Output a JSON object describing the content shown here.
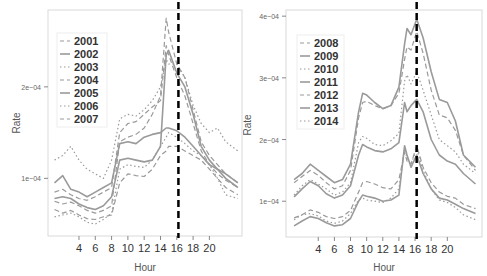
{
  "chart_data": [
    {
      "type": "line",
      "title": "",
      "xlabel": "Hour",
      "ylabel": "Rate",
      "x_ticks": [
        4,
        6,
        8,
        10,
        12,
        14,
        16,
        18,
        20
      ],
      "y_ticks": [
        {
          "value": 0.0001,
          "label": "1e−04"
        },
        {
          "value": 0.0002,
          "label": "2e−04"
        }
      ],
      "xlim": [
        0.2,
        24
      ],
      "ylim": [
        3.7e-05,
        0.000284
      ],
      "vline": {
        "x": 16.2,
        "style": "dashed",
        "color": "#000000"
      },
      "grid": false,
      "legend_position": "top-left inside",
      "x": [
        1,
        2,
        3,
        4,
        5,
        6,
        7,
        8,
        9,
        10,
        11,
        12,
        13,
        14,
        14.7,
        15,
        16,
        17,
        18,
        19,
        20,
        21,
        22,
        23.5
      ],
      "series": [
        {
          "name": "2001",
          "style": "dashed",
          "values": [
            0.66,
            0.62,
            0.65,
            0.6,
            0.56,
            0.55,
            0.58,
            0.6,
            0.95,
            1.05,
            1.03,
            1.02,
            1.1,
            1.25,
            1.3,
            1.35,
            1.35,
            1.3,
            1.25,
            1.2,
            1.1,
            1.0,
            0.9,
            0.82
          ]
        },
        {
          "name": "2002",
          "style": "solid",
          "values": [
            0.78,
            0.8,
            0.78,
            0.72,
            0.68,
            0.66,
            0.7,
            0.8,
            1.2,
            1.22,
            1.2,
            1.18,
            1.2,
            1.35,
            2.35,
            2.4,
            2.15,
            2.0,
            1.7,
            1.35,
            1.2,
            1.1,
            1.0,
            0.9
          ]
        },
        {
          "name": "2003",
          "style": "dotted",
          "values": [
            1.2,
            1.25,
            1.35,
            1.2,
            1.1,
            1.05,
            1.0,
            1.2,
            1.65,
            1.7,
            1.68,
            1.75,
            1.85,
            2.0,
            2.3,
            2.25,
            2.25,
            2.1,
            1.8,
            1.6,
            1.5,
            1.55,
            1.4,
            1.3
          ]
        },
        {
          "name": "2004",
          "style": "dashed",
          "values": [
            0.75,
            0.72,
            0.74,
            0.7,
            0.65,
            0.62,
            0.65,
            0.7,
            1.4,
            1.45,
            1.48,
            1.55,
            1.7,
            1.9,
            2.75,
            2.6,
            2.25,
            2.1,
            1.75,
            1.4,
            1.25,
            1.15,
            1.05,
            0.95
          ]
        },
        {
          "name": "2005",
          "style": "solid",
          "values": [
            0.95,
            1.03,
            0.88,
            0.85,
            0.8,
            0.85,
            0.9,
            0.95,
            1.38,
            1.4,
            1.38,
            1.45,
            1.48,
            1.5,
            1.55,
            1.55,
            1.52,
            1.45,
            1.35,
            1.25,
            1.15,
            1.1,
            1.05,
            0.95
          ]
        },
        {
          "name": "2006",
          "style": "dotted",
          "values": [
            0.58,
            0.6,
            0.62,
            0.58,
            0.52,
            0.5,
            0.55,
            0.62,
            1.1,
            1.15,
            1.13,
            1.12,
            1.2,
            1.35,
            1.45,
            1.5,
            1.45,
            1.38,
            1.3,
            1.25,
            1.15,
            1.0,
            0.82,
            0.78
          ]
        },
        {
          "name": "2007",
          "style": "dashed",
          "values": [
            0.85,
            0.88,
            0.82,
            0.78,
            0.76,
            0.8,
            0.85,
            0.9,
            1.5,
            1.6,
            1.62,
            1.7,
            1.78,
            1.85,
            2.45,
            2.35,
            2.1,
            1.9,
            1.6,
            1.3,
            1.15,
            1.05,
            0.98,
            0.9
          ]
        }
      ]
    },
    {
      "type": "line",
      "title": "",
      "xlabel": "Hour",
      "ylabel": "Rate",
      "x_ticks": [
        4,
        6,
        8,
        10,
        12,
        14,
        16,
        18,
        20
      ],
      "y_ticks": [
        {
          "value": 0.0001,
          "label": "1e−04"
        },
        {
          "value": 0.0002,
          "label": "2e−04"
        },
        {
          "value": 0.0003,
          "label": "3e−04"
        },
        {
          "value": 0.0004,
          "label": "4e−04"
        }
      ],
      "xlim": [
        0,
        24.3
      ],
      "ylim": [
        4.2e-05,
        0.00041
      ],
      "vline": {
        "x": 16.2,
        "style": "dashed",
        "color": "#000000"
      },
      "grid": false,
      "legend_position": "top-left inside",
      "x": [
        1,
        2,
        3,
        4,
        5,
        6,
        7,
        8,
        9,
        9.5,
        10,
        11,
        12,
        13,
        14,
        14.7,
        15,
        15.5,
        16.2,
        17,
        18,
        19,
        20,
        21,
        22,
        23.5
      ],
      "series": [
        {
          "name": "2008",
          "style": "dashed",
          "values": [
            0.73,
            0.78,
            0.86,
            0.82,
            0.75,
            0.72,
            0.75,
            0.85,
            1.15,
            1.3,
            1.32,
            1.28,
            1.22,
            1.2,
            1.35,
            1.8,
            1.65,
            1.6,
            1.9,
            1.55,
            1.3,
            1.15,
            1.08,
            1.05,
            0.95,
            0.88
          ]
        },
        {
          "name": "2009",
          "style": "solid",
          "values": [
            1.35,
            1.45,
            1.6,
            1.5,
            1.4,
            1.3,
            1.35,
            1.6,
            2.45,
            2.75,
            2.72,
            2.6,
            2.5,
            2.55,
            2.85,
            3.55,
            3.8,
            3.7,
            3.95,
            3.65,
            3.1,
            2.65,
            2.6,
            2.3,
            1.75,
            1.55
          ]
        },
        {
          "name": "2010",
          "style": "dotted",
          "values": [
            1.1,
            1.25,
            1.35,
            1.28,
            1.2,
            1.1,
            1.15,
            1.3,
            1.95,
            2.05,
            2.02,
            1.92,
            1.9,
            1.98,
            2.1,
            2.95,
            3.05,
            2.9,
            3.1,
            2.8,
            2.4,
            2.0,
            1.9,
            1.8,
            1.6,
            1.45
          ]
        },
        {
          "name": "2011",
          "style": "solid",
          "values": [
            1.07,
            1.2,
            1.32,
            1.25,
            1.12,
            1.05,
            1.1,
            1.25,
            1.75,
            1.92,
            1.88,
            1.82,
            1.8,
            1.85,
            1.95,
            2.6,
            2.45,
            2.55,
            2.65,
            2.45,
            2.0,
            1.75,
            1.65,
            1.6,
            1.45,
            1.28
          ]
        },
        {
          "name": "2012",
          "style": "dashed",
          "values": [
            1.3,
            1.4,
            1.5,
            1.42,
            1.3,
            1.2,
            1.25,
            1.5,
            2.35,
            2.6,
            2.62,
            2.55,
            2.5,
            2.55,
            2.75,
            3.3,
            3.5,
            3.45,
            3.75,
            3.4,
            2.8,
            2.4,
            2.35,
            2.15,
            1.75,
            1.5
          ]
        },
        {
          "name": "2013",
          "style": "solid",
          "values": [
            0.6,
            0.68,
            0.75,
            0.72,
            0.65,
            0.6,
            0.62,
            0.72,
            1.0,
            1.1,
            1.08,
            1.05,
            1.0,
            1.02,
            1.1,
            1.9,
            1.75,
            1.55,
            1.75,
            1.45,
            1.2,
            1.05,
            1.02,
            0.95,
            0.88,
            0.8
          ]
        },
        {
          "name": "2014",
          "style": "dotted",
          "values": [
            0.7,
            0.78,
            0.8,
            0.76,
            0.68,
            0.64,
            0.68,
            0.8,
            1.02,
            1.05,
            1.02,
            1.0,
            0.98,
            1.05,
            1.2,
            1.85,
            1.7,
            1.6,
            1.85,
            1.5,
            1.2,
            1.02,
            0.98,
            0.9,
            0.78,
            0.7
          ]
        }
      ]
    }
  ],
  "panels": [
    {
      "legend": [
        "2001",
        "2002",
        "2003",
        "2004",
        "2005",
        "2006",
        "2007"
      ],
      "xlabel": "Hour",
      "ylabel": "Rate",
      "tick_labels_x": [
        "4",
        "6",
        "8",
        "10",
        "12",
        "14",
        "16",
        "18",
        "20"
      ],
      "tick_labels_y": [
        "1e−04",
        "2e−04"
      ]
    },
    {
      "legend": [
        "2008",
        "2009",
        "2010",
        "2011",
        "2012",
        "2013",
        "2014"
      ],
      "xlabel": "Hour",
      "ylabel": "Rate",
      "tick_labels_x": [
        "4",
        "6",
        "8",
        "10",
        "12",
        "14",
        "16",
        "18",
        "20"
      ],
      "tick_labels_y": [
        "1e−04",
        "2e−04",
        "3e−04",
        "4e−04"
      ]
    }
  ],
  "colors": {
    "line": "#9a9a9a",
    "frame": "#d6d6d6",
    "axis_text": "#555555",
    "legend_text": "#333333",
    "vline": "#000000"
  }
}
